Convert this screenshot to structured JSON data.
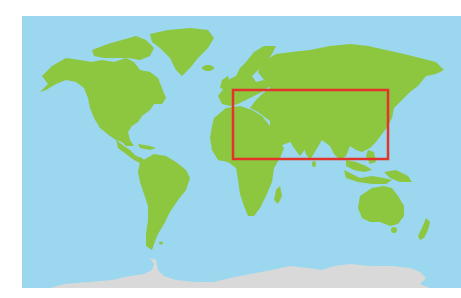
{
  "map": {
    "type": "world-map",
    "projection": "equirectangular-like",
    "colors": {
      "ocean": "#9bd7ef",
      "land": "#8dc63f",
      "antarctica": "#d9d9d9",
      "highlight": "#e2342a",
      "background": "#ffffff"
    },
    "continents": [
      "North America",
      "Greenland",
      "South America",
      "Europe",
      "Africa",
      "Asia",
      "Australia",
      "New Zealand",
      "Antarctica"
    ],
    "highlight_region": {
      "label": "Eurasia / Middle East / South Asia / East Asia",
      "bounds_px": {
        "x": 232,
        "y": 89,
        "width": 157,
        "height": 71
      }
    }
  }
}
